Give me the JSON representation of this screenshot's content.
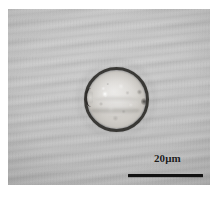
{
  "figure": {
    "kind": "light-micrograph",
    "alt": "Light micrograph of a single spheroidal pollen grain with a thick dark exine wall on a gray slide background"
  },
  "background": {
    "field_color": "#b9b9b9",
    "mount_color": "#ffffff",
    "artifact": "diagonal scan banding"
  },
  "specimen": {
    "name": "pollen-grain",
    "shape": "spheroidal",
    "wall_label": "exine",
    "wall_color": "#262421",
    "interior_color": "#cecbc6",
    "features": [
      "colpus-notch-left",
      "pore-right",
      "equatorial-fold",
      "bright-inclusion",
      "granular-protoplast"
    ]
  },
  "scale_bar": {
    "label": "20μm",
    "value": 20,
    "unit": "μm",
    "bar_color": "#121212",
    "length_px": 75
  }
}
